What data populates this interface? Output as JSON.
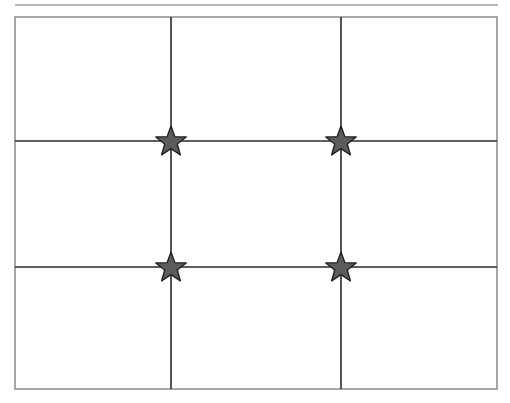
{
  "diagram": {
    "grid": {
      "rows": 3,
      "columns": 3
    },
    "colors": {
      "background": "#ffffff",
      "frame": "#8a8a8a",
      "top_rule": "#a0a0a0",
      "grid_lines": "#2a2a2a",
      "star_fill": "#5c5c5c",
      "star_stroke": "#222222"
    },
    "markers": [
      {
        "name": "star-top-left-intersection",
        "col_line": 1,
        "row_line": 1,
        "icon": "star-icon"
      },
      {
        "name": "star-top-right-intersection",
        "col_line": 2,
        "row_line": 1,
        "icon": "star-icon"
      },
      {
        "name": "star-bottom-left-intersection",
        "col_line": 1,
        "row_line": 2,
        "icon": "star-icon"
      },
      {
        "name": "star-bottom-right-intersection",
        "col_line": 2,
        "row_line": 2,
        "icon": "star-icon"
      }
    ]
  }
}
